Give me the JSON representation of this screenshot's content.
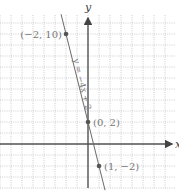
{
  "chart_data": {
    "type": "line",
    "title": "",
    "xlabel": "x",
    "ylabel": "y",
    "xlim": [
      -8,
      8
    ],
    "ylim": [
      -4,
      11.7
    ],
    "grid": true,
    "series": [
      {
        "name": "y = −4x + 2",
        "slope": -4,
        "intercept": 2,
        "label": "y = −4x + 2"
      }
    ],
    "points": [
      {
        "x": -2,
        "y": 10,
        "label": "(−2, 10)",
        "label_side": "left"
      },
      {
        "x": 0,
        "y": 2,
        "label": "(0, 2)",
        "label_side": "right"
      },
      {
        "x": 1,
        "y": -2,
        "label": "(1, −2)",
        "label_side": "right"
      }
    ],
    "line_extent_x": [
      -2.45,
      1.55
    ]
  }
}
